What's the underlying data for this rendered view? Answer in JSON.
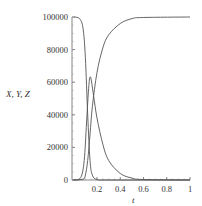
{
  "chart_data": {
    "type": "line",
    "title": "",
    "xlabel": "t",
    "ylabel": "X, Y, Z",
    "xlim": [
      0,
      1
    ],
    "ylim": [
      0,
      100000
    ],
    "grid": false,
    "legend": null,
    "x_ticks": [
      "0.2",
      "0.4",
      "0.6",
      "0.8",
      "1"
    ],
    "y_ticks": [
      "0",
      "20000",
      "40000",
      "60000",
      "80000",
      "100000"
    ],
    "series": [
      {
        "name": "X",
        "description": "decreasing population, drops steeply from 100000 to 0",
        "x": [
          0.0,
          0.05,
          0.08,
          0.1,
          0.12,
          0.14,
          0.16,
          0.2,
          0.3,
          1.0
        ],
        "values": [
          100000,
          99000,
          93000,
          75000,
          40000,
          12000,
          3000,
          300,
          0,
          0
        ]
      },
      {
        "name": "Y",
        "description": "peak curve, max about 63000 near t=0.14, slow decay to 0 by t=0.6",
        "x": [
          0.0,
          0.06,
          0.09,
          0.11,
          0.13,
          0.145,
          0.17,
          0.2,
          0.25,
          0.3,
          0.4,
          0.5,
          0.6,
          1.0
        ],
        "values": [
          0,
          1500,
          12000,
          35000,
          58000,
          63000,
          52000,
          38000,
          22000,
          12000,
          4000,
          1200,
          300,
          0
        ]
      },
      {
        "name": "Z",
        "description": "increasing population, rises from 0 to 100000",
        "x": [
          0.0,
          0.08,
          0.1,
          0.12,
          0.14,
          0.16,
          0.2,
          0.25,
          0.3,
          0.4,
          0.5,
          0.6,
          1.0
        ],
        "values": [
          0,
          500,
          3000,
          12000,
          28000,
          45000,
          66000,
          81000,
          89000,
          96000,
          99000,
          99700,
          100000
        ]
      }
    ]
  }
}
